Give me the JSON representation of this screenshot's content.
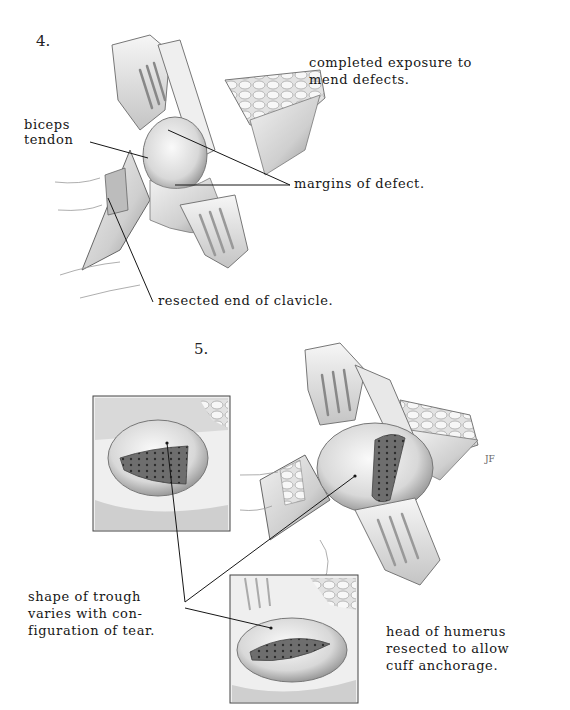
{
  "figure4": {
    "number": "4.",
    "caption_line1": "completed exposure to",
    "caption_line2": "mend defects.",
    "labels": {
      "biceps_line1": "biceps",
      "biceps_line2": "tendon",
      "margins": "margins of defect.",
      "clavicle": "resected end of clavicle."
    }
  },
  "figure5": {
    "number": "5.",
    "labels": {
      "trough_line1": "shape of trough",
      "trough_line2": "varies with con-",
      "trough_line3": "figuration of tear.",
      "humerus_line1": "head of humerus",
      "humerus_line2": "resected to allow",
      "humerus_line3": "cuff anchorage."
    },
    "signature": "JF"
  },
  "colors": {
    "ink": "#161616",
    "tissue_light": "#e6e6e6",
    "tissue_mid": "#bdbdbd",
    "tissue_dark": "#7a7a7a",
    "background": "#ffffff"
  }
}
